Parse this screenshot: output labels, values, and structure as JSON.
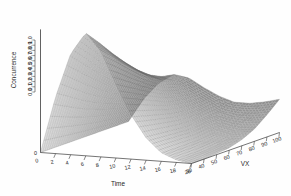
{
  "chart_data": {
    "type": "surface",
    "title": "",
    "xlabel": "Time",
    "ylabel": "VX",
    "zlabel": "Concurrence",
    "xlim": [
      0,
      20
    ],
    "ylim": [
      30,
      100
    ],
    "zlim": [
      0.0,
      1.0
    ],
    "xticks": [
      "0",
      "2",
      "4",
      "6",
      "8",
      "10",
      "12",
      "14",
      "16",
      "18",
      "20"
    ],
    "yticks": [
      "30",
      "40",
      "50",
      "60",
      "70",
      "80",
      "90",
      "100"
    ],
    "zticks": [
      "0.0",
      "0.1",
      "0.2",
      "0.3",
      "0.4",
      "0.5",
      "0.6",
      "0.7",
      "0.8",
      "0.9",
      "1.0"
    ],
    "grid": true,
    "legend": "none",
    "mesh_color": "#6e6e6e",
    "background": "#ffffff",
    "x": [
      0,
      2,
      4,
      6,
      8,
      10,
      12,
      14,
      16,
      18,
      20
    ],
    "y": [
      30,
      40,
      50,
      60,
      70,
      80,
      90,
      100
    ],
    "z": [
      [
        0.0,
        0.0,
        0.0,
        0.0,
        0.0,
        0.0,
        0.0,
        0.0
      ],
      [
        0.46,
        0.4,
        0.34,
        0.29,
        0.25,
        0.22,
        0.2,
        0.19
      ],
      [
        0.82,
        0.72,
        0.62,
        0.53,
        0.45,
        0.39,
        0.35,
        0.33
      ],
      [
        1.0,
        0.89,
        0.77,
        0.66,
        0.56,
        0.48,
        0.43,
        0.41
      ],
      [
        0.86,
        0.77,
        0.67,
        0.58,
        0.5,
        0.44,
        0.4,
        0.39
      ],
      [
        0.6,
        0.54,
        0.48,
        0.42,
        0.37,
        0.34,
        0.32,
        0.32
      ],
      [
        0.36,
        0.33,
        0.3,
        0.27,
        0.25,
        0.24,
        0.24,
        0.26
      ],
      [
        0.18,
        0.17,
        0.16,
        0.15,
        0.15,
        0.16,
        0.18,
        0.22
      ],
      [
        0.07,
        0.07,
        0.07,
        0.07,
        0.08,
        0.11,
        0.16,
        0.22
      ],
      [
        0.02,
        0.02,
        0.02,
        0.03,
        0.05,
        0.09,
        0.16,
        0.24
      ],
      [
        0.0,
        0.0,
        0.01,
        0.02,
        0.05,
        0.1,
        0.18,
        0.27
      ]
    ]
  },
  "axes": {
    "x_label": "Time",
    "y_label": "VX",
    "z_label": "Concurrence"
  },
  "ticks": {
    "x": [
      "0",
      "2",
      "4",
      "6",
      "8",
      "10",
      "12",
      "14",
      "16",
      "18",
      "20"
    ],
    "y": [
      "30",
      "40",
      "50",
      "60",
      "70",
      "80",
      "90",
      "100"
    ],
    "z": [
      "0.0",
      "0.1",
      "0.2",
      "0.3",
      "0.4",
      "0.5",
      "0.6",
      "0.7",
      "0.8",
      "0.9",
      "1.0"
    ]
  },
  "origin_label": "0"
}
